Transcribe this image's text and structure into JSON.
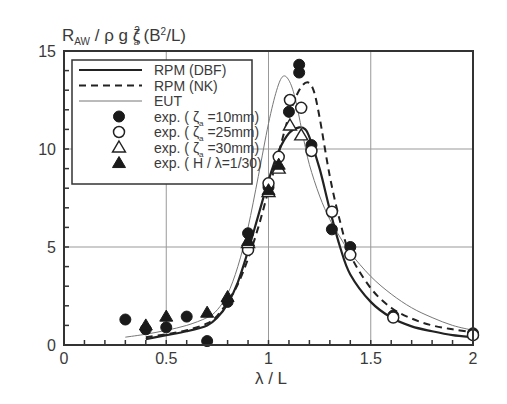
{
  "chart_data": {
    "type": "line",
    "title": "",
    "ylabel_parts": {
      "main": "R",
      "sub": "AW",
      "rest1": " / ρ g ζ",
      "sup": "2",
      "sub2": "a",
      "rest2": " (B",
      "sup2": "2",
      "rest3": "/L)"
    },
    "xlabel": "λ / L",
    "xlim": [
      0,
      2
    ],
    "ylim": [
      0,
      15
    ],
    "xticks": [
      0,
      0.5,
      1,
      1.5,
      2
    ],
    "xtick_labels": [
      "0",
      "0.5",
      "1",
      "1.5",
      "2"
    ],
    "yticks": [
      0,
      5,
      10,
      15
    ],
    "ytick_labels": [
      "0",
      "5",
      "10",
      "15"
    ],
    "x_minor_step": 0.1,
    "y_minor_step": 1,
    "grid": true,
    "legend_position": "top-left",
    "legend": [
      {
        "label": "RPM (DBF)",
        "kind": "line",
        "style": "solid"
      },
      {
        "label": "RPM (NK)",
        "kind": "line",
        "style": "dashed"
      },
      {
        "label": "EUT",
        "kind": "line",
        "style": "thin"
      },
      {
        "label": "exp. ( ζ a =10mm)",
        "label_parts": [
          "exp. ( ζ",
          "a",
          " =10mm)"
        ],
        "kind": "marker",
        "marker": "filled-circle"
      },
      {
        "label": "exp. ( ζ a =25mm)",
        "label_parts": [
          "exp. ( ζ",
          "a",
          " =25mm)"
        ],
        "kind": "marker",
        "marker": "open-circle"
      },
      {
        "label": "exp. ( ζ a =30mm)",
        "label_parts": [
          "exp. ( ζ",
          "a",
          " =30mm)"
        ],
        "kind": "marker",
        "marker": "open-triangle"
      },
      {
        "label": "exp. ( H / λ=1/30)",
        "label_parts": [
          "exp. ( H / λ=1/30)",
          "",
          ""
        ],
        "kind": "marker",
        "marker": "filled-triangle"
      }
    ],
    "series": [
      {
        "name": "RPM (DBF)",
        "style": "solid",
        "x": [
          0.4,
          0.5,
          0.6,
          0.7,
          0.75,
          0.8,
          0.85,
          0.9,
          0.95,
          1.0,
          1.05,
          1.1,
          1.15,
          1.18,
          1.2,
          1.25,
          1.3,
          1.35,
          1.4,
          1.5,
          1.6,
          1.7,
          1.8,
          1.9,
          2.0
        ],
        "y": [
          0.3,
          0.5,
          0.7,
          1.0,
          1.4,
          2.1,
          3.2,
          4.8,
          6.6,
          8.4,
          9.9,
          10.8,
          11.1,
          11.0,
          10.6,
          9.0,
          6.9,
          5.0,
          3.6,
          2.2,
          1.4,
          0.95,
          0.7,
          0.5,
          0.4
        ]
      },
      {
        "name": "RPM (NK)",
        "style": "dashed",
        "x": [
          0.4,
          0.5,
          0.6,
          0.7,
          0.75,
          0.8,
          0.85,
          0.9,
          0.95,
          1.0,
          1.05,
          1.1,
          1.15,
          1.19,
          1.22,
          1.25,
          1.3,
          1.35,
          1.4,
          1.5,
          1.6,
          1.7,
          1.8,
          1.9,
          2.0
        ],
        "y": [
          0.4,
          0.55,
          0.75,
          1.1,
          1.5,
          2.2,
          3.1,
          4.4,
          6.0,
          7.9,
          9.8,
          11.7,
          13.0,
          13.4,
          13.0,
          11.6,
          8.6,
          6.3,
          4.6,
          2.9,
          1.9,
          1.35,
          1.0,
          0.8,
          0.65
        ]
      },
      {
        "name": "EUT",
        "style": "thin",
        "x": [
          0.3,
          0.4,
          0.5,
          0.6,
          0.7,
          0.75,
          0.8,
          0.85,
          0.9,
          0.95,
          1.0,
          1.04,
          1.07,
          1.1,
          1.13,
          1.17,
          1.2,
          1.25,
          1.3,
          1.35,
          1.4,
          1.5,
          1.6,
          1.7,
          1.8,
          1.9,
          2.0
        ],
        "y": [
          0.4,
          0.55,
          0.75,
          1.0,
          1.4,
          1.8,
          2.6,
          4.0,
          6.0,
          8.6,
          11.3,
          13.0,
          13.7,
          13.5,
          12.6,
          10.6,
          9.2,
          7.6,
          6.4,
          5.5,
          4.7,
          3.5,
          2.6,
          1.9,
          1.4,
          1.0,
          0.75
        ]
      }
    ],
    "points": [
      {
        "name": "exp. ( ζ a =10mm)",
        "marker": "filled-circle",
        "x": [
          0.3,
          0.4,
          0.5,
          0.6,
          0.7,
          0.8,
          0.9,
          1.0,
          1.1,
          1.15,
          1.15,
          1.21,
          1.31,
          1.4,
          1.61,
          2.0
        ],
        "y": [
          1.3,
          0.8,
          0.9,
          1.45,
          0.2,
          2.2,
          5.7,
          8.05,
          11.9,
          14.3,
          13.9,
          10.2,
          5.9,
          5.0,
          1.5,
          0.6
        ]
      },
      {
        "name": "exp. ( ζ a =25mm)",
        "marker": "open-circle",
        "x": [
          0.9,
          1.0,
          1.05,
          1.105,
          1.16,
          1.21,
          1.31,
          1.4,
          1.61,
          2.0
        ],
        "y": [
          4.85,
          8.25,
          9.6,
          12.5,
          12.1,
          9.9,
          6.8,
          4.6,
          1.4,
          0.5
        ]
      },
      {
        "name": "exp. ( ζ a =30mm)",
        "marker": "open-triangle",
        "x": [
          0.9,
          1.0,
          1.05,
          1.105,
          1.16
        ],
        "y": [
          5.2,
          7.8,
          9.0,
          11.2,
          10.7
        ]
      },
      {
        "name": "exp. ( H / λ=1/30)",
        "marker": "filled-triangle",
        "x": [
          0.4,
          0.5,
          0.7,
          0.8,
          0.9,
          1.0,
          1.05
        ],
        "y": [
          1.0,
          1.45,
          1.65,
          2.45,
          5.3,
          7.9,
          9.2
        ]
      }
    ]
  }
}
